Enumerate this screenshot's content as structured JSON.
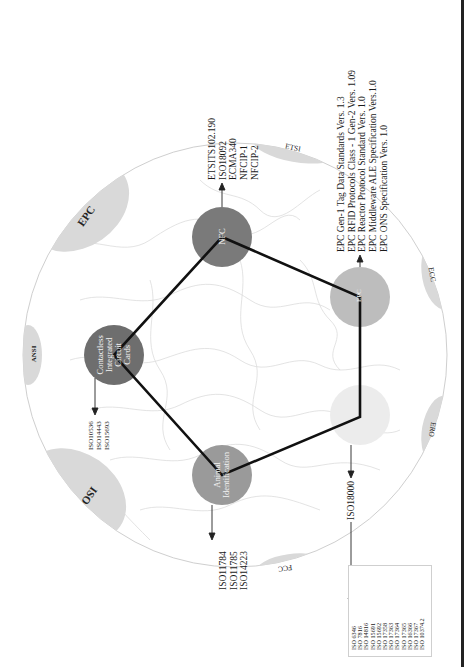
{
  "figure": {
    "orientation": "rotated-90-ccw",
    "globe": {
      "fill": "#ffffff",
      "outline": "#cfcfcf",
      "map_lines": "#d8d8d8"
    },
    "organizations": [
      {
        "id": "epc",
        "label": "EPC"
      },
      {
        "id": "ansi",
        "label": "ANSI"
      },
      {
        "id": "iso",
        "label": "ISO"
      },
      {
        "id": "fcc",
        "label": "FCC"
      },
      {
        "id": "ero",
        "label": "ERO"
      },
      {
        "id": "ecc",
        "label": "ECC"
      },
      {
        "id": "etsi",
        "label": "ETSI"
      }
    ],
    "nodes": [
      {
        "id": "nfc",
        "label_lines": [
          "NFC"
        ],
        "color": "#7a7a7a"
      },
      {
        "id": "epc-node",
        "label_lines": [
          "EPC"
        ],
        "color": "#bdbdbd"
      },
      {
        "id": "iso18000-node",
        "label_lines": [
          ""
        ],
        "color": "#ececec"
      },
      {
        "id": "animal",
        "label_lines": [
          "Animal",
          "Identification"
        ],
        "color": "#9a9a9a"
      },
      {
        "id": "contactless",
        "label_lines": [
          "Contactless",
          "Integrated",
          "Circuit",
          "Cards"
        ],
        "color": "#6e6e6e"
      }
    ],
    "standards": {
      "nfc": [
        "ETSITS102.190",
        "ISO18092",
        "ECMA340",
        "NFCIP-1",
        "NFCIP-2"
      ],
      "epc": [
        "EPC Gen-1 Tag Data Standards Vers. 1.3",
        "EPC RFID Protocols Class - 1 Gen-2 Vers. 1.09",
        "EPC Reactor Protocol Standard Vers. 1.0",
        "EPC Middleware ALE Specification Vers.1.0",
        "EPC ONS Specification Vers. 1.0"
      ],
      "contactless": [
        "ISO10536",
        "ISO14443",
        "ISO15693"
      ],
      "animal": [
        "ISO11784",
        "ISO11785",
        "ISO14223"
      ],
      "iso18000": [
        "ISO18000"
      ],
      "iso_list": [
        "ISO 6346",
        "ISO 7816",
        "ISO 14816",
        "ISO 15691",
        "ISO 15692",
        "ISO 17358",
        "ISO 17363",
        "ISO 17364",
        "ISO 17365",
        "ISO 16366",
        "ISO 17367",
        "ISO 10374.2"
      ]
    }
  }
}
